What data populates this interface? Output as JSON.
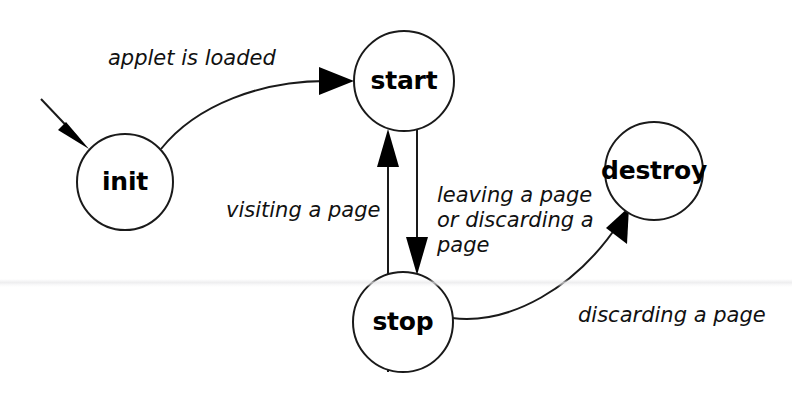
{
  "diagram": {
    "kind": "state-diagram",
    "background_color": "#ffffff",
    "stroke_color": "#1a1a1a",
    "text_color": "#000000",
    "nodes": [
      {
        "id": "init",
        "label": "init",
        "cx": 125,
        "cy": 182,
        "r": 48
      },
      {
        "id": "start",
        "label": "start",
        "cx": 404,
        "cy": 81,
        "r": 50
      },
      {
        "id": "stop",
        "label": "stop",
        "cx": 403,
        "cy": 322,
        "r": 50
      },
      {
        "id": "destroy",
        "label": "destroy",
        "cx": 654,
        "cy": 171,
        "r": 49
      }
    ],
    "edges": [
      {
        "id": "entry",
        "from": "",
        "to": "init",
        "label": ""
      },
      {
        "id": "init-to-start",
        "from": "init",
        "to": "start",
        "label": "applet is loaded"
      },
      {
        "id": "stop-to-start",
        "from": "stop",
        "to": "start",
        "label": "visiting a page"
      },
      {
        "id": "start-to-stop",
        "from": "start",
        "to": "stop",
        "label": "leaving a page or discarding a page"
      },
      {
        "id": "stop-to-destroy",
        "from": "stop",
        "to": "destroy",
        "label": "discarding a page"
      }
    ],
    "labels": {
      "applet_is_loaded": "applet is loaded",
      "visiting_a_page": "visiting a page",
      "leaving_line_1": "leaving a page",
      "leaving_line_2": "or discarding a",
      "leaving_line_3": "page",
      "discarding_a_page": "discarding a page"
    }
  }
}
